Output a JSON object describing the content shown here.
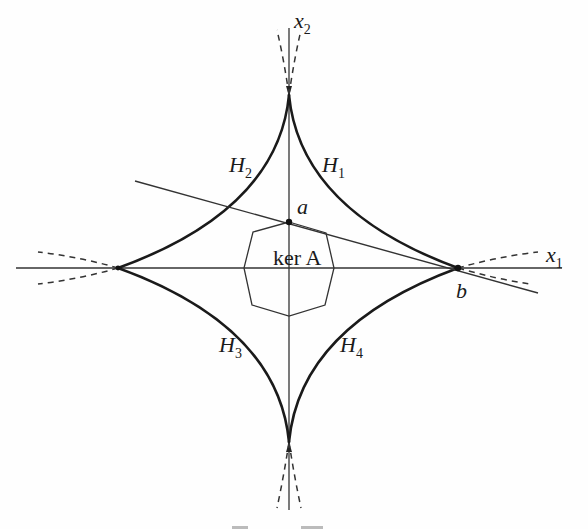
{
  "figure": {
    "axes": {
      "x_axis": {
        "label": "x",
        "subscript": "1"
      },
      "y_axis": {
        "label": "x",
        "subscript": "2"
      }
    },
    "curves": [
      {
        "id": "H1",
        "label": "H",
        "subscript": "1",
        "quadrant": "upper-right"
      },
      {
        "id": "H2",
        "label": "H",
        "subscript": "2",
        "quadrant": "upper-left"
      },
      {
        "id": "H3",
        "label": "H",
        "subscript": "3",
        "quadrant": "lower-left"
      },
      {
        "id": "H4",
        "label": "H",
        "subscript": "4",
        "quadrant": "lower-right"
      }
    ],
    "points": {
      "a": "a",
      "b": "b"
    },
    "region_label": "ker A",
    "colors": {
      "ink": "#1a1a1a",
      "thin": "#333333",
      "background": "#fefefe"
    }
  }
}
